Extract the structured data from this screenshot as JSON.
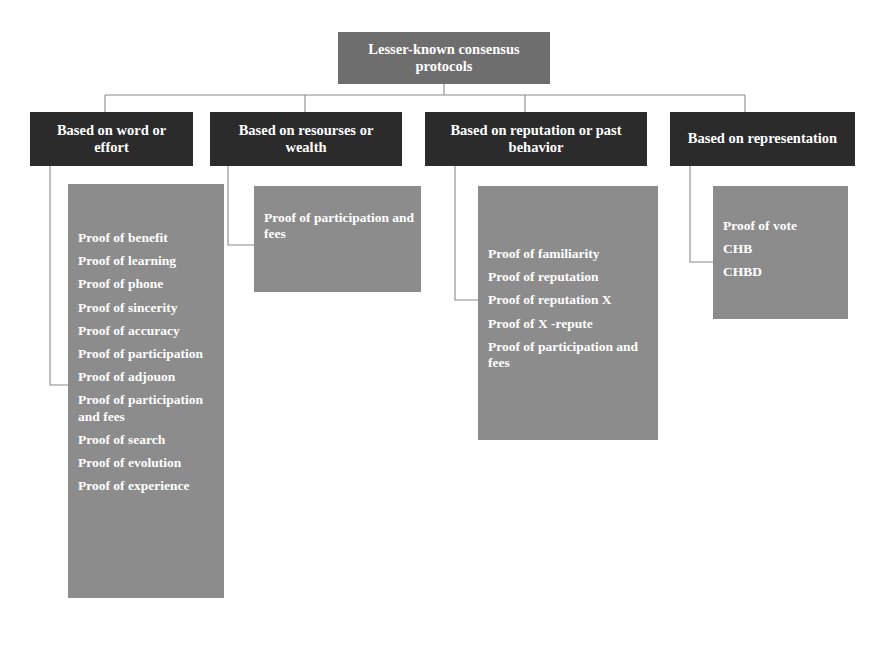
{
  "diagram": {
    "type": "hierarchy-tree",
    "root": {
      "label": "Lesser-known consensus protocols"
    },
    "colors": {
      "root_fill": "#6e6e6e",
      "header_fill": "#2b2b2b",
      "panel_fill": "#8c8c8c",
      "text": "#ffffff",
      "connector": "#8a8a8a",
      "background": "#ffffff"
    },
    "branches": [
      {
        "header": "Based on word or effort",
        "items": [
          "Proof of benefit",
          "Proof of learning",
          "Proof of phone",
          "Proof of sincerity",
          "Proof of accuracy",
          "Proof of participation",
          "Proof of adjouon",
          "Proof of participation and fees",
          "Proof of search",
          "Proof of evolution",
          "Proof of experience"
        ]
      },
      {
        "header": "Based on resourses or wealth",
        "items": [
          "Proof of participation and fees"
        ]
      },
      {
        "header": "Based on reputation or past behavior",
        "items": [
          "Proof of familiarity",
          "Proof of reputation",
          "Proof of reputation X",
          "Proof of X -repute",
          "Proof of participation and fees"
        ]
      },
      {
        "header": "Based on representation",
        "items": [
          "Proof of vote",
          "CHB",
          "CHBD"
        ]
      }
    ]
  }
}
